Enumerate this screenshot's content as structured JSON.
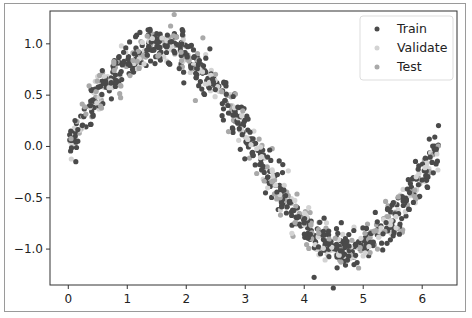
{
  "chart_data": {
    "type": "scatter",
    "title": "",
    "xlabel": "",
    "ylabel": "",
    "xlim": [
      -0.31,
      6.59
    ],
    "ylim": [
      -1.35,
      1.32
    ],
    "x_ticks": [
      0,
      1,
      2,
      3,
      4,
      5,
      6
    ],
    "x_tick_labels": [
      "0",
      "1",
      "2",
      "3",
      "4",
      "5",
      "6"
    ],
    "y_ticks": [
      1.0,
      0.5,
      0.0,
      -0.5,
      -1.0
    ],
    "y_tick_labels": [
      "1.0",
      "0.5",
      "0.0",
      "−0.5",
      "−1.0"
    ],
    "grid": false,
    "legend_position": "upper right",
    "underlying_function": "y = sin(x) + noise(sd≈0.1), x in [0, 2π]",
    "series": [
      {
        "name": "Train",
        "color": "#4a4a4a",
        "count": 600
      },
      {
        "name": "Validate",
        "color": "#d3d3d3",
        "count": 200
      },
      {
        "name": "Test",
        "color": "#a9a9a9",
        "count": 200
      }
    ]
  },
  "legend": {
    "items": [
      {
        "label": "Train",
        "color": "#4a4a4a"
      },
      {
        "label": "Validate",
        "color": "#d3d3d3"
      },
      {
        "label": "Test",
        "color": "#a9a9a9"
      }
    ]
  }
}
